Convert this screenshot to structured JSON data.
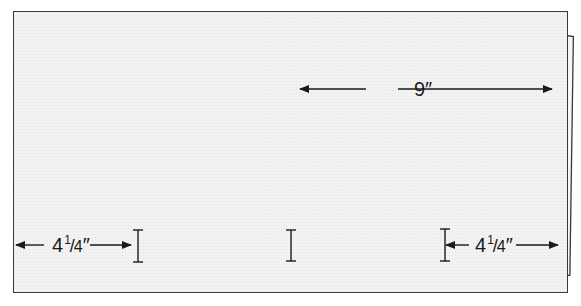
{
  "diagram": {
    "type": "folded-card-measurement",
    "colors": {
      "paper": "#f4f4f4",
      "outline": "#3a3a3a",
      "ink": "#1a1a1a"
    },
    "dimensions": {
      "total_width": {
        "whole": "9",
        "unit": "″",
        "text": "9″"
      },
      "left_panel": {
        "whole": "4",
        "num": "1",
        "slash": "/",
        "den": "4",
        "unit": "″",
        "text": "4 1/4″"
      },
      "right_panel": {
        "whole": "4",
        "num": "1",
        "slash": "/",
        "den": "4",
        "unit": "″",
        "text": "4 1/4″"
      }
    },
    "markers": [
      {
        "name": "left-score-mark"
      },
      {
        "name": "center-score-mark"
      },
      {
        "name": "right-score-mark"
      }
    ]
  }
}
